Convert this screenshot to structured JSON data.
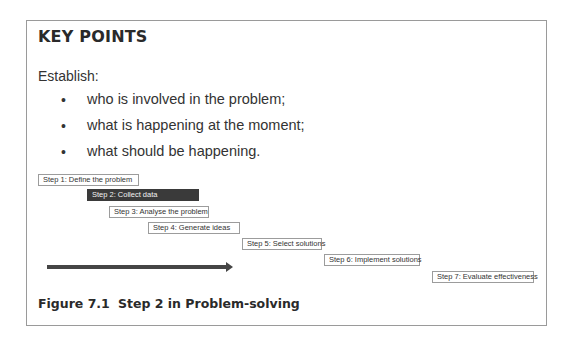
{
  "box": {
    "heading": "KEY POINTS",
    "intro": "Establish:",
    "bullets": [
      {
        "marker": "•",
        "text": "who is involved in the problem;"
      },
      {
        "marker": "•",
        "text": "what is happening at the moment;"
      },
      {
        "marker": "•",
        "text": "what should be happening."
      }
    ]
  },
  "diagram": {
    "steps": [
      {
        "label": "Step 1: Define the problem",
        "active": false
      },
      {
        "label": "Step 2: Collect data",
        "active": true
      },
      {
        "label": "Step 3: Analyse the problem",
        "active": false
      },
      {
        "label": "Step 4: Generate ideas",
        "active": false
      },
      {
        "label": "Step 5: Select solutions",
        "active": false
      },
      {
        "label": "Step 6: Implement solutions",
        "active": false
      },
      {
        "label": "Step 7: Evaluate effectiveness",
        "active": false
      }
    ],
    "arrow": "progress-arrow",
    "colors": {
      "active_fill": "#3a3a3a",
      "border": "#9c9c9c",
      "arrow": "#454545"
    }
  },
  "caption": {
    "number": "Figure 7.1",
    "title": "Step 2 in Problem-solving"
  }
}
